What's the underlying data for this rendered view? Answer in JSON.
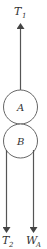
{
  "diagram": {
    "type": "free-body diagram",
    "bodies": [
      {
        "id": "A",
        "label": "A"
      },
      {
        "id": "B",
        "label": "B"
      }
    ],
    "forces": [
      {
        "id": "T1",
        "label": "T",
        "subscript": "1",
        "direction": "up"
      },
      {
        "id": "T2",
        "label": "T",
        "subscript": "2",
        "direction": "down"
      },
      {
        "id": "WA",
        "label": "W",
        "subscript": "A",
        "direction": "down"
      }
    ],
    "colors": {
      "line": "#555555",
      "text": "#333333"
    }
  }
}
